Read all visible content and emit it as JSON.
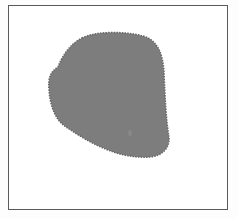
{
  "figure": {
    "shape_fill": "#7d7d7d",
    "shape_outline": "#666666",
    "frame_color": "#5a5a5a",
    "background": "#ffffff"
  }
}
